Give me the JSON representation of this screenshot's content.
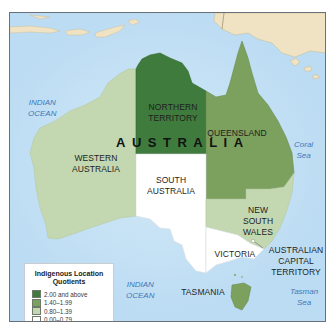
{
  "map": {
    "country_label": "AUSTRALIA",
    "oceans": [
      {
        "name": "indian-ocean-north",
        "line1": "INDIAN",
        "line2": "OCEAN"
      },
      {
        "name": "indian-ocean-south",
        "line1": "INDIAN",
        "line2": "OCEAN"
      },
      {
        "name": "coral-sea",
        "line1": "Coral",
        "line2": "Sea"
      },
      {
        "name": "tasman-sea",
        "line1": "Tasman",
        "line2": "Sea"
      }
    ],
    "regions": [
      {
        "id": "nt",
        "line1": "NORTHERN",
        "line2": "TERRITORY",
        "class": "2.00 and above",
        "color": "#3f7b3c"
      },
      {
        "id": "qld",
        "line1": "QUEENSLAND",
        "line2": "",
        "class": "1.40–1.99",
        "color": "#7ca05e"
      },
      {
        "id": "wa",
        "line1": "WESTERN",
        "line2": "AUSTRALIA",
        "class": "0.80–1.39",
        "color": "#c3d8b0"
      },
      {
        "id": "sa",
        "line1": "SOUTH",
        "line2": "AUSTRALIA",
        "class": "0.00–0.79",
        "color": "#ffffff"
      },
      {
        "id": "nsw",
        "line1": "NEW",
        "line2": "SOUTH",
        "line3": "WALES",
        "class": "0.80–1.39",
        "color": "#c3d8b0"
      },
      {
        "id": "vic",
        "line1": "VICTORIA",
        "class": "0.00–0.79",
        "color": "#ffffff"
      },
      {
        "id": "tas",
        "line1": "TASMANIA",
        "class": "1.40–1.99",
        "color": "#7ca05e"
      },
      {
        "id": "act",
        "line1": "AUSTRALIAN",
        "line2": "CAPITAL",
        "line3": "TERRITORY",
        "class": "0.00–0.79",
        "color": "#ffffff"
      }
    ],
    "colors": {
      "water": "#bcdcf3",
      "foreign_land": "#efe3c4",
      "border": "#6a6f78"
    }
  },
  "legend": {
    "title_line1": "Indigenous Location",
    "title_line2": "Quotients",
    "items": [
      {
        "label": "2.00 and above",
        "color": "#3f7b3c"
      },
      {
        "label": "1.40–1.99",
        "color": "#7ca05e"
      },
      {
        "label": "0.80–1.39",
        "color": "#c3d8b0"
      },
      {
        "label": "0.00–0.79",
        "color": "#ffffff"
      }
    ]
  }
}
